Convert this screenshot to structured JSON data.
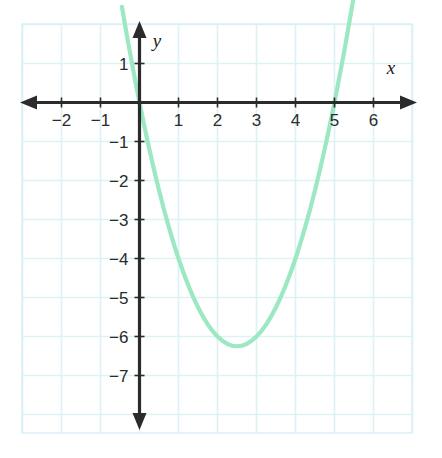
{
  "figure": {
    "title": "",
    "background_color": "#ffffff",
    "grid_color": "#ddf2f5",
    "grid_border_color": "#cfeef2",
    "axis_color": "#2b2b2b",
    "curve_color": "#9ce8c2",
    "x_axis_name": "x",
    "y_axis_name": "y"
  },
  "chart_data": {
    "type": "line",
    "title": "",
    "subtitle": "",
    "xlabel": "x",
    "ylabel": "y",
    "grid": true,
    "legend": "none",
    "xlim": [
      -2.95,
      7.05
    ],
    "ylim": [
      -8.45,
      2.05
    ],
    "x_ticks": [
      -2,
      -1,
      1,
      2,
      3,
      4,
      5,
      6
    ],
    "x_tick_labels": [
      "−2",
      "−1",
      "1",
      "2",
      "3",
      "4",
      "5",
      "6"
    ],
    "y_ticks": [
      1,
      -1,
      -2,
      -3,
      -4,
      -5,
      -6,
      -7
    ],
    "y_tick_labels": [
      "1",
      "−1",
      "−2",
      "−3",
      "−4",
      "−5",
      "−6",
      "−7"
    ],
    "x_major_step": 1,
    "y_major_step": 1,
    "series": [
      {
        "name": "parabola",
        "equation": "y = x^2 - 5x",
        "color": "#9ce8c2",
        "vertex": [
          2.5,
          -6.25
        ],
        "roots": [
          0,
          5
        ],
        "y_intercept": 0,
        "x": [
          -0.45,
          -0.3,
          -0.15,
          0,
          0.25,
          0.5,
          0.75,
          1,
          1.25,
          1.5,
          1.75,
          2,
          2.25,
          2.5,
          2.75,
          3,
          3.25,
          3.5,
          3.75,
          4,
          4.25,
          4.5,
          4.75,
          5,
          5.25,
          5.5,
          5.75
        ],
        "y": [
          2.4525,
          1.59,
          0.7725,
          0,
          -1.1875,
          -2.25,
          -3.1875,
          -4,
          -4.6875,
          -5.25,
          -5.6875,
          -6,
          -6.1875,
          -6.25,
          -6.1875,
          -6,
          -5.6875,
          -5.25,
          -4.6875,
          -4,
          -3.1875,
          -2.25,
          -1.1875,
          0,
          1.3125,
          2.75,
          4.3125
        ]
      }
    ]
  }
}
